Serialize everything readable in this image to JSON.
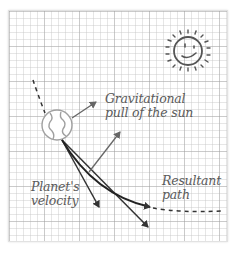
{
  "diagram": {
    "labels": {
      "gravity_line1": "Gravitational",
      "gravity_line2": "pull of the sun",
      "velocity_line1": "Planet's",
      "velocity_line2": "velocity",
      "resultant_line1": "Resultant",
      "resultant_line2": "path"
    },
    "icons": {
      "sun": "smiling-sun-icon",
      "planet": "planet-earth-icon"
    },
    "colors": {
      "ink": "#3a3a3a",
      "text": "#5a5a5a",
      "grid": "#cccccc",
      "planet_outline": "#a0a0a0"
    }
  }
}
